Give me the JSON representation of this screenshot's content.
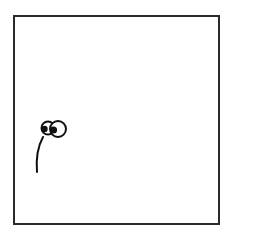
{
  "panel": {
    "frame_color": "#2a2a2a",
    "background": "#ffffff",
    "figure": "eyes-on-stalk-doodle"
  },
  "caption": {
    "text": ""
  }
}
